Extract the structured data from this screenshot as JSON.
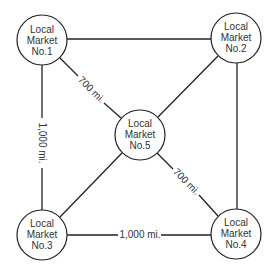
{
  "diagram": {
    "type": "network",
    "nodes": [
      {
        "id": "m1",
        "lines": [
          "Local",
          "Market",
          "No.1"
        ],
        "cx": 42,
        "cy": 40,
        "r": 25
      },
      {
        "id": "m2",
        "lines": [
          "Local",
          "Market",
          "No.2"
        ],
        "cx": 236,
        "cy": 38,
        "r": 25
      },
      {
        "id": "m3",
        "lines": [
          "Local",
          "Market",
          "No.3"
        ],
        "cx": 42,
        "cy": 235,
        "r": 25
      },
      {
        "id": "m4",
        "lines": [
          "Local",
          "Market",
          "No.4"
        ],
        "cx": 236,
        "cy": 234,
        "r": 25
      },
      {
        "id": "m5",
        "lines": [
          "Local",
          "Market",
          "No.5"
        ],
        "cx": 140,
        "cy": 135,
        "r": 25
      }
    ],
    "edges": [
      {
        "from": "m1",
        "to": "m2",
        "label": ""
      },
      {
        "from": "m1",
        "to": "m3",
        "label": "1,000 mi."
      },
      {
        "from": "m1",
        "to": "m5",
        "label": "700 mi."
      },
      {
        "from": "m2",
        "to": "m4",
        "label": ""
      },
      {
        "from": "m2",
        "to": "m5",
        "label": ""
      },
      {
        "from": "m3",
        "to": "m4",
        "label": "1,000 mi."
      },
      {
        "from": "m3",
        "to": "m5",
        "label": ""
      },
      {
        "from": "m5",
        "to": "m4",
        "label": "700 mi."
      }
    ],
    "colors": {
      "line": "#222222",
      "text": "#333333",
      "fill": "#ffffff"
    }
  }
}
